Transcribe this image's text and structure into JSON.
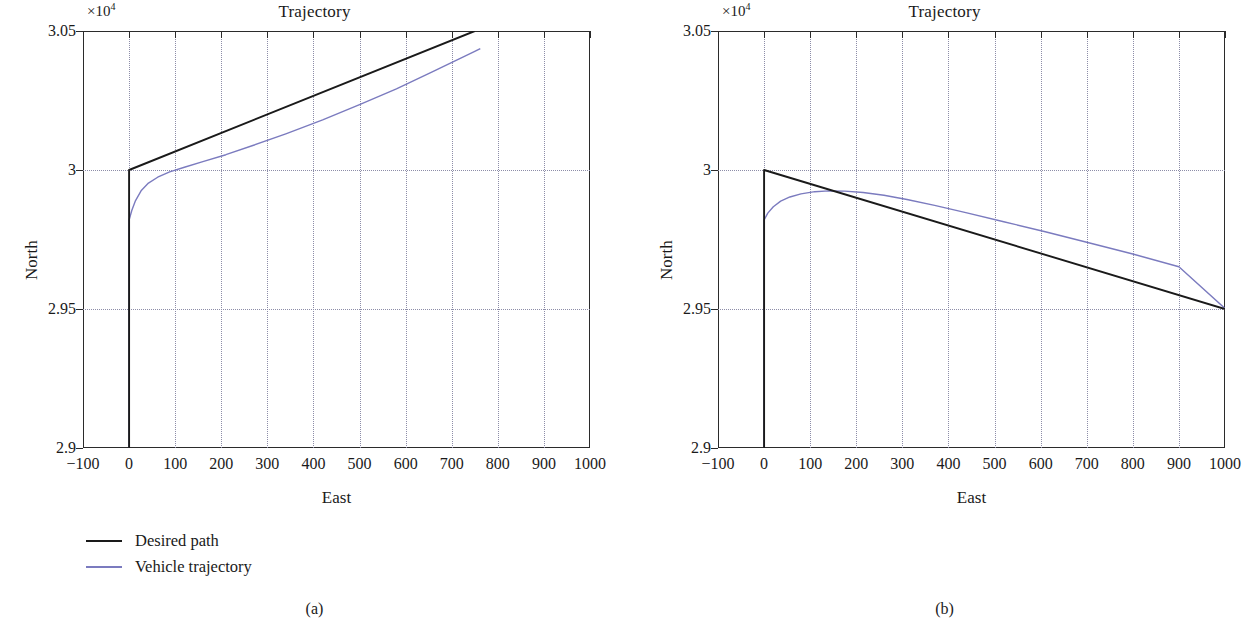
{
  "figure": {
    "panels": [
      {
        "caption": "(a)",
        "title": "Trajectory",
        "exponent_label": "×10",
        "exponent_power": "4",
        "xlabel": "East",
        "ylabel": "North"
      },
      {
        "caption": "(b)",
        "title": "Trajectory",
        "exponent_label": "×10",
        "exponent_power": "4",
        "xlabel": "East",
        "ylabel": "North"
      }
    ],
    "legend": {
      "desired_path": "Desired path",
      "vehicle_trajectory": "Vehicle trajectory"
    },
    "colors": {
      "desired_path": "#1a1a1a",
      "vehicle_trajectory": "#7b7bbf",
      "grid": "#8d8da8",
      "axis": "#2b2b2b"
    }
  },
  "chart_data": [
    {
      "type": "line",
      "title": "Trajectory",
      "xlabel": "East",
      "ylabel": "North",
      "y_exponent": 10000,
      "xlim": [
        -100,
        1000
      ],
      "ylim": [
        29000,
        30500
      ],
      "xticks": [
        -100,
        0,
        100,
        200,
        300,
        400,
        500,
        600,
        700,
        800,
        900,
        1000
      ],
      "xticklabels": [
        "−100",
        "0",
        "100",
        "200",
        "300",
        "400",
        "500",
        "600",
        "700",
        "800",
        "900",
        "1000"
      ],
      "yticks": [
        29000,
        29500,
        30000,
        30500
      ],
      "yticklabels": [
        "2.9",
        "2.95",
        "3",
        "3.05"
      ],
      "grid": true,
      "legend_position": "below-left",
      "series": [
        {
          "name": "Desired path",
          "color": "#1a1a1a",
          "points": [
            [
              0,
              29000
            ],
            [
              0,
              30000
            ],
            [
              750,
              30500
            ]
          ]
        },
        {
          "name": "Vehicle trajectory",
          "color": "#7b7bbf",
          "points": [
            [
              0,
              29000
            ],
            [
              0,
              29820
            ],
            [
              6,
              29855
            ],
            [
              14,
              29890
            ],
            [
              26,
              29925
            ],
            [
              42,
              29953
            ],
            [
              62,
              29974
            ],
            [
              88,
              29993
            ],
            [
              120,
              30010
            ],
            [
              160,
              30030
            ],
            [
              210,
              30055
            ],
            [
              270,
              30089
            ],
            [
              340,
              30130
            ],
            [
              420,
              30180
            ],
            [
              500,
              30235
            ],
            [
              580,
              30292
            ],
            [
              660,
              30355
            ],
            [
              750,
              30427
            ],
            [
              762,
              30437
            ]
          ]
        }
      ]
    },
    {
      "type": "line",
      "title": "Trajectory",
      "xlabel": "East",
      "ylabel": "North",
      "y_exponent": 10000,
      "xlim": [
        -100,
        1000
      ],
      "ylim": [
        29000,
        30500
      ],
      "xticks": [
        -100,
        0,
        100,
        200,
        300,
        400,
        500,
        600,
        700,
        800,
        900,
        1000
      ],
      "xticklabels": [
        "−100",
        "0",
        "100",
        "200",
        "300",
        "400",
        "500",
        "600",
        "700",
        "800",
        "900",
        "1000"
      ],
      "yticks": [
        29000,
        29500,
        30000,
        30500
      ],
      "yticklabels": [
        "2.9",
        "2.95",
        "3",
        "3.05"
      ],
      "grid": true,
      "legend_position": "below-left",
      "series": [
        {
          "name": "Desired path",
          "color": "#1a1a1a",
          "points": [
            [
              0,
              29000
            ],
            [
              0,
              30000
            ],
            [
              1000,
              29500
            ]
          ]
        },
        {
          "name": "Vehicle trajectory",
          "color": "#7b7bbf",
          "points": [
            [
              0,
              29000
            ],
            [
              0,
              29820
            ],
            [
              8,
              29845
            ],
            [
              20,
              29868
            ],
            [
              36,
              29888
            ],
            [
              56,
              29903
            ],
            [
              80,
              29914
            ],
            [
              110,
              29922
            ],
            [
              140,
              29925
            ],
            [
              175,
              29924
            ],
            [
              215,
              29919
            ],
            [
              260,
              29909
            ],
            [
              310,
              29894
            ],
            [
              370,
              29873
            ],
            [
              440,
              29846
            ],
            [
              520,
              29814
            ],
            [
              610,
              29778
            ],
            [
              700,
              29740
            ],
            [
              800,
              29698
            ],
            [
              900,
              29652
            ],
            [
              1000,
              29502
            ]
          ]
        }
      ]
    }
  ]
}
